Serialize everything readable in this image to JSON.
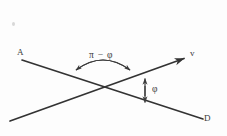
{
  "figure": {
    "background_color": "#fdfdfd",
    "stroke_color": "#333333",
    "text_color": "#3a3a3a",
    "labels": {
      "line_a_start": "A",
      "line_d_end": "D",
      "vector_v": "v",
      "angle_outer": "π − φ",
      "angle_inner": "φ"
    },
    "geometry": {
      "canvas": {
        "width": 227,
        "height": 136
      },
      "intersection": {
        "x": 105,
        "y": 88
      },
      "line_AD": {
        "x1": 22,
        "y1": 60,
        "x2": 203,
        "y2": 119
      },
      "line_v": {
        "x1": 10,
        "y1": 121,
        "x2": 188,
        "y2": 57
      },
      "arrow_v_tip": {
        "x": 188,
        "y": 57
      },
      "arc_outer": {
        "start_x": 70,
        "start_y": 77,
        "end_x": 136,
        "end_y": 77,
        "apex_y": 58
      },
      "arrow_phi": {
        "x": 145,
        "y_top": 76,
        "y_bottom": 105
      }
    }
  }
}
